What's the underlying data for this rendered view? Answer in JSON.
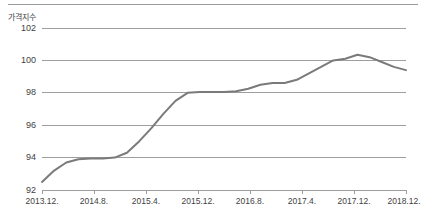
{
  "chart_data": {
    "type": "line",
    "title": "",
    "ylabel": "가격지수",
    "xlabel": "",
    "ylim": [
      92,
      102
    ],
    "y_ticks": [
      92,
      94,
      96,
      98,
      100,
      102
    ],
    "grid": true,
    "legend": "none",
    "line_color": "#7a7a7a",
    "x_tick_labels": [
      "2013.12.",
      "2014.8.",
      "2015.4.",
      "2015.12.",
      "2016.8.",
      "2017.4.",
      "2017.12.",
      "2018.12."
    ],
    "x_tick_values": [
      "2013.12",
      "2014.8",
      "2015.4",
      "2015.12",
      "2016.8",
      "2017.4",
      "2017.12",
      "2018.12"
    ],
    "x": [
      "2013.12",
      "2014.2",
      "2014.4",
      "2014.6",
      "2014.8",
      "2014.10",
      "2014.12",
      "2015.2",
      "2015.4",
      "2015.6",
      "2015.8",
      "2015.10",
      "2015.12",
      "2016.2",
      "2016.4",
      "2016.6",
      "2016.8",
      "2016.10",
      "2016.12",
      "2017.2",
      "2017.4",
      "2017.6",
      "2017.8",
      "2017.10",
      "2017.12",
      "2018.2",
      "2018.4",
      "2018.6",
      "2018.8",
      "2018.10",
      "2018.12"
    ],
    "values": [
      92.5,
      93.2,
      93.7,
      93.9,
      93.95,
      93.95,
      94.0,
      94.3,
      95.0,
      95.8,
      96.7,
      97.5,
      98.0,
      98.05,
      98.05,
      98.05,
      98.1,
      98.25,
      98.5,
      98.6,
      98.6,
      98.8,
      99.2,
      99.6,
      100.0,
      100.1,
      100.35,
      100.2,
      99.9,
      99.6,
      99.4
    ],
    "series": [
      {
        "name": "가격지수",
        "values": [
          92.5,
          93.2,
          93.7,
          93.9,
          93.95,
          93.95,
          94.0,
          94.3,
          95.0,
          95.8,
          96.7,
          97.5,
          98.0,
          98.05,
          98.05,
          98.05,
          98.1,
          98.25,
          98.5,
          98.6,
          98.6,
          98.8,
          99.2,
          99.6,
          100.0,
          100.1,
          100.35,
          100.2,
          99.9,
          99.6,
          99.4
        ]
      }
    ]
  },
  "axis": {
    "y_title": "가격지수",
    "y_tick_labels": [
      "102",
      "100",
      "98",
      "96",
      "94",
      "92"
    ],
    "x_tick_labels": [
      "2013.12.",
      "2014.8.",
      "2015.4.",
      "2015.12.",
      "2016.8.",
      "2017.4.",
      "2017.12.",
      "2018.12."
    ]
  }
}
